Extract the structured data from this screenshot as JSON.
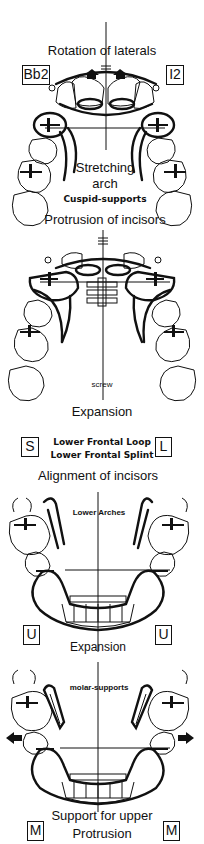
{
  "figure": {
    "panels": [
      {
        "id": "upper-rotation",
        "title": "Rotation of laterals",
        "left_box": "Bb2",
        "right_box": "I2",
        "inner_labels": [
          "Stretching",
          "arch",
          "Cuspid-supports"
        ],
        "bottom_label": "Protrusion of incisors"
      },
      {
        "id": "upper-expansion",
        "inner_labels": [
          "screw"
        ],
        "bottom_label": "Expansion"
      },
      {
        "id": "lower-frontal",
        "left_box": "S",
        "right_box": "L",
        "lines": [
          "Lower Frontal Loop",
          "Lower Frontal Splint"
        ],
        "bottom_label": "Alignment of incisors"
      },
      {
        "id": "lower-arches",
        "inner_labels": [
          "Lower Arches"
        ],
        "left_box": "U",
        "right_box": "U",
        "bottom_label": "Expansion"
      },
      {
        "id": "lower-molar-support",
        "inner_labels": [
          "molar-supports"
        ],
        "left_box": "M",
        "right_box": "M",
        "bottom_label_lines": [
          "Support for upper",
          "Protrusion"
        ]
      }
    ]
  }
}
